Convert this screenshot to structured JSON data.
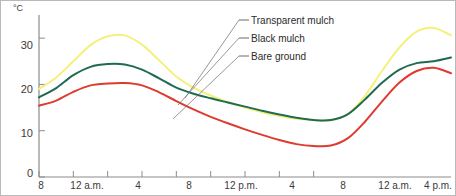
{
  "chart_data": {
    "type": "line",
    "title": "",
    "xlabel": "",
    "ylabel": "°C",
    "ylim": [
      0,
      35
    ],
    "yticks": [
      0,
      10,
      20,
      30
    ],
    "grid": false,
    "legend_position": "top-right-callout",
    "x": [
      8,
      10,
      12,
      14,
      16,
      18,
      20,
      22,
      24,
      26,
      28,
      30,
      32,
      34,
      36,
      38,
      40,
      42,
      44,
      46,
      48,
      50,
      52,
      54,
      56
    ],
    "xticks": [
      {
        "x": 8,
        "label": "8"
      },
      {
        "x": 12,
        "label": "12 a.m."
      },
      {
        "x": 16,
        "label": "4"
      },
      {
        "x": 20,
        "label": "8"
      },
      {
        "x": 24,
        "label": "12 p.m."
      },
      {
        "x": 28,
        "label": "4"
      },
      {
        "x": 32,
        "label": "8"
      },
      {
        "x": 36,
        "label": "12 a.m."
      },
      {
        "x": 40,
        "label": "4 p.m."
      }
    ],
    "series": [
      {
        "name": "Transparent mulch",
        "color": "#f5f07a",
        "values": [
          19.0,
          21.5,
          25.0,
          28.5,
          30.4,
          30.6,
          28.6,
          25.2,
          21.7,
          19.3,
          17.6,
          16.2,
          15.0,
          14.0,
          13.2,
          12.6,
          12.3,
          12.2,
          13.6,
          17.6,
          23.0,
          28.0,
          31.4,
          32.2,
          30.6
        ]
      },
      {
        "name": "Black mulch",
        "color": "#1f6b52",
        "values": [
          17.2,
          19.2,
          22.0,
          23.8,
          24.4,
          24.3,
          23.2,
          21.3,
          19.3,
          18.0,
          17.0,
          16.1,
          15.2,
          14.3,
          13.5,
          12.8,
          12.3,
          12.3,
          13.6,
          16.8,
          20.4,
          23.2,
          24.6,
          25.0,
          25.8
        ]
      },
      {
        "name": "Bare ground",
        "color": "#e03a2f",
        "values": [
          15.4,
          16.5,
          18.4,
          19.8,
          20.2,
          20.3,
          19.8,
          18.3,
          16.4,
          14.6,
          13.0,
          11.6,
          10.3,
          9.1,
          8.0,
          7.1,
          6.7,
          6.8,
          8.4,
          12.0,
          16.4,
          20.4,
          22.9,
          23.6,
          22.4
        ]
      }
    ]
  },
  "legend": {
    "items": [
      {
        "label": "Transparent mulch"
      },
      {
        "label": "Black mulch"
      },
      {
        "label": "Bare ground"
      }
    ]
  },
  "axes": {
    "y_unit_label": "°C",
    "y_tick_labels": [
      "0",
      "10",
      "20",
      "30"
    ],
    "x_tick_labels": [
      "8",
      "12 a.m.",
      "4",
      "8",
      "12 p.m.",
      "4",
      "8",
      "12 a.m.",
      "4 p.m."
    ]
  }
}
